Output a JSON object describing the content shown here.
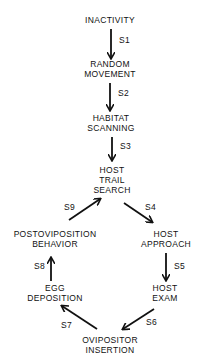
{
  "diagram": {
    "type": "behavioral-sequence-flowchart",
    "nodes": [
      {
        "id": "inactivity",
        "lines": [
          "INACTIVITY"
        ]
      },
      {
        "id": "random_movement",
        "lines": [
          "RANDOM",
          "MOVEMENT"
        ]
      },
      {
        "id": "habitat_scanning",
        "lines": [
          "HABITAT",
          "SCANNING"
        ]
      },
      {
        "id": "host_trail_search",
        "lines": [
          "HOST",
          "TRAIL",
          "SEARCH"
        ]
      },
      {
        "id": "host_approach",
        "lines": [
          "HOST",
          "APPROACH"
        ]
      },
      {
        "id": "host_exam",
        "lines": [
          "HOST",
          "EXAM"
        ]
      },
      {
        "id": "ovipositor_insertion",
        "lines": [
          "OVIPOSITOR",
          "INSERTION"
        ]
      },
      {
        "id": "egg_deposition",
        "lines": [
          "EGG",
          "DEPOSITION"
        ]
      },
      {
        "id": "postoviposition_behavior",
        "lines": [
          "POSTOVIPOSITION",
          "BEHAVIOR"
        ]
      }
    ],
    "edges": [
      {
        "label": "S1",
        "from": "inactivity",
        "to": "random_movement"
      },
      {
        "label": "S2",
        "from": "random_movement",
        "to": "habitat_scanning"
      },
      {
        "label": "S3",
        "from": "habitat_scanning",
        "to": "host_trail_search"
      },
      {
        "label": "S4",
        "from": "host_trail_search",
        "to": "host_approach"
      },
      {
        "label": "S5",
        "from": "host_approach",
        "to": "host_exam"
      },
      {
        "label": "S6",
        "from": "host_exam",
        "to": "ovipositor_insertion"
      },
      {
        "label": "S7",
        "from": "ovipositor_insertion",
        "to": "egg_deposition"
      },
      {
        "label": "S8",
        "from": "egg_deposition",
        "to": "postoviposition_behavior"
      },
      {
        "label": "S9",
        "from": "postoviposition_behavior",
        "to": "host_trail_search"
      }
    ]
  }
}
